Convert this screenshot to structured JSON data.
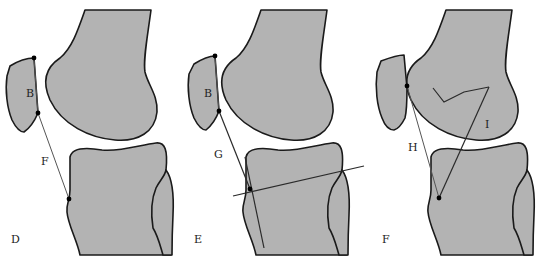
{
  "figure": {
    "colors": {
      "bone_fill": "#b3b3b3",
      "outline": "#1a1a1a",
      "background": "#ffffff"
    },
    "panels": [
      {
        "id": "D",
        "label": "D",
        "patella_label": "B",
        "line_label": "F"
      },
      {
        "id": "E",
        "label": "E",
        "patella_label": "B",
        "line_label": "G"
      },
      {
        "id": "F",
        "label": "F",
        "line_label_1": "H",
        "line_label_2": "I"
      }
    ]
  }
}
